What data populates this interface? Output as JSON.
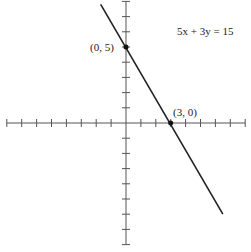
{
  "chart_data": {
    "type": "line",
    "title": "",
    "equation_label": "5x + 3y = 15",
    "xlabel": "",
    "ylabel": "",
    "xlim": [
      -8,
      8
    ],
    "ylim": [
      -8,
      8
    ],
    "grid": false,
    "tick_spacing": 1,
    "series": [
      {
        "name": "5x + 3y = 15",
        "x": [
          -1.7,
          6.5
        ],
        "y": [
          7.8,
          -6.0
        ]
      }
    ],
    "points": [
      {
        "label": "(0, 5)",
        "x": 0,
        "y": 5
      },
      {
        "label": "(3, 0)",
        "x": 3,
        "y": 0
      }
    ],
    "colors": {
      "axis": "#555555",
      "line": "#222222",
      "point": "#111111"
    }
  }
}
